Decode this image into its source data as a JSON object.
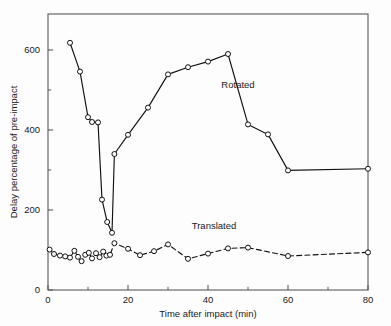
{
  "chart_data": {
    "type": "line",
    "title": "",
    "xlabel": "Time after impact (min)",
    "ylabel": "Delay percentage of pre-impact",
    "xlim": [
      0,
      80
    ],
    "ylim": [
      0,
      690
    ],
    "grid": false,
    "legend_position": "inline-annotation",
    "xticks": [
      0,
      20,
      40,
      60,
      80
    ],
    "xticklabels": [
      "0",
      "20",
      "40",
      "60",
      "80"
    ],
    "xminorticks": [
      10,
      30,
      50,
      70
    ],
    "yticks": [
      0,
      200,
      400,
      600
    ],
    "yticklabels": [
      "0",
      "200",
      "400",
      "600"
    ],
    "yminorticks": [
      100,
      300,
      500
    ],
    "series": [
      {
        "name": "Rotated",
        "linestyle": "solid",
        "marker": "open-circle",
        "color": "#111111",
        "points": [
          [
            5.5,
            618
          ],
          [
            8.0,
            546
          ],
          [
            10.0,
            432
          ],
          [
            11.0,
            420
          ],
          [
            12.5,
            419
          ],
          [
            13.5,
            226
          ],
          [
            14.8,
            170
          ],
          [
            16.0,
            143
          ],
          [
            16.6,
            340
          ],
          [
            20.0,
            388
          ],
          [
            25.0,
            456
          ],
          [
            30.0,
            539
          ],
          [
            35.0,
            557
          ],
          [
            40.0,
            571
          ],
          [
            45.0,
            590
          ],
          [
            50.0,
            414
          ],
          [
            55.0,
            389
          ],
          [
            60.0,
            299
          ],
          [
            80.0,
            303
          ]
        ]
      },
      {
        "name": "Translated",
        "linestyle": "dashed",
        "marker": "open-circle",
        "color": "#111111",
        "points": [
          [
            0.4,
            101
          ],
          [
            1.5,
            90
          ],
          [
            3.0,
            86
          ],
          [
            4.3,
            84
          ],
          [
            5.5,
            81
          ],
          [
            6.6,
            98
          ],
          [
            7.5,
            83
          ],
          [
            8.4,
            72
          ],
          [
            9.3,
            88
          ],
          [
            10.2,
            93
          ],
          [
            11.0,
            79
          ],
          [
            12.0,
            92
          ],
          [
            12.9,
            82
          ],
          [
            13.8,
            96
          ],
          [
            14.6,
            86
          ],
          [
            15.5,
            88
          ],
          [
            16.6,
            117
          ],
          [
            20.0,
            103
          ],
          [
            23.0,
            87
          ],
          [
            26.5,
            97
          ],
          [
            30.0,
            114
          ],
          [
            35.0,
            78
          ],
          [
            40.0,
            91
          ],
          [
            45.0,
            104
          ],
          [
            50.0,
            106
          ],
          [
            60.0,
            85
          ],
          [
            80.0,
            94
          ]
        ]
      }
    ],
    "annotations": [
      {
        "text": "Rotated",
        "x": 47.5,
        "y": 505
      },
      {
        "text": "Translated",
        "x": 41.5,
        "y": 152
      }
    ]
  },
  "axes": {
    "x_title": "Time after impact (min)",
    "y_title": "Delay percentage of pre-impact",
    "x_labels": [
      "0",
      "20",
      "40",
      "60",
      "80"
    ],
    "y_labels": [
      "0",
      "200",
      "400",
      "600"
    ]
  },
  "colors": {
    "line": "#111111",
    "frame": "#555555",
    "background": "#fdfdfd",
    "marker_fill": "#ffffff"
  }
}
